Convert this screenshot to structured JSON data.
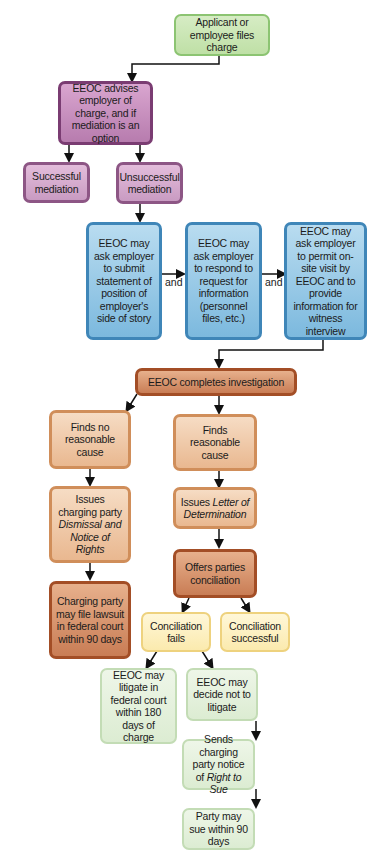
{
  "diagram": {
    "colors": {
      "start": "#c8e6b0",
      "mediation": "#c08bb7",
      "requests": "#8fc4e4",
      "investigation": "#d58e65",
      "findings": "#f0c8a6",
      "conciliation_outcome": "#fcefc0",
      "litigation": "#e4f0dc"
    },
    "nodes": {
      "files_charge": "Applicant or employee files charge",
      "advises": "EEOC advises employer of charge, and if mediation is an option",
      "successful_mediation": "Successful mediation",
      "unsuccessful_mediation": "Unsuccessful mediation",
      "submit_statement": "EEOC may ask employer to submit statement of position of employer's side of story",
      "respond_request": "EEOC may ask employer to respond to request for information (personnel files, etc.)",
      "onsite_visit": "EEOC may ask employer to permit on-site visit by EEOC and to provide information for witness interview",
      "completes_investigation": "EEOC completes investigation",
      "no_cause": "Finds no reasonable cause",
      "cause": "Finds reasonable cause",
      "dismissal_pre": "Issues charging party ",
      "dismissal_em": "Dismissal and Notice of Rights",
      "letter_pre": "Issues ",
      "letter_em": "Letter of Determination",
      "offers_conciliation": "Offers parties conciliation",
      "file_lawsuit": "Charging party may file lawsuit in federal court within 90 days",
      "conciliation_fails": "Conciliation fails",
      "conciliation_successful": "Conciliation successful",
      "may_litigate": "EEOC may litigate in federal court within 180 days of charge",
      "not_litigate": "EEOC may decide not to litigate",
      "right_to_sue_pre": "Sends charging party notice of ",
      "right_to_sue_em": "Right to Sue",
      "party_may_sue": "Party may sue within 90 days"
    },
    "connectors": {
      "and_1": "and",
      "and_2": "and"
    }
  }
}
